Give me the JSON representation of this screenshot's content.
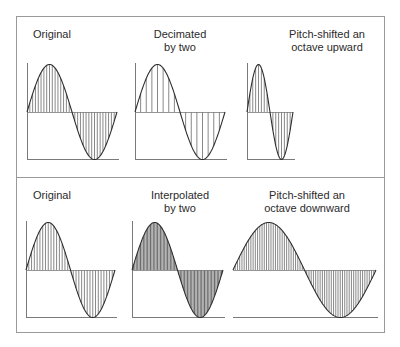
{
  "colors": {
    "frame": "#9a9a9a",
    "curve": "#2e2e2e",
    "hatch": "#555555",
    "axis": "#7a7a7a",
    "dense_fill": "#8a8a8a"
  },
  "panels": [
    {
      "name": "top",
      "labels": [
        {
          "lines": [
            "Original"
          ]
        },
        {
          "lines": [
            "Decimated",
            "by two"
          ]
        },
        {
          "lines": [
            "Pitch-shifted an",
            "octave upward"
          ]
        }
      ]
    },
    {
      "name": "bottom",
      "labels": [
        {
          "lines": [
            "Original"
          ]
        },
        {
          "lines": [
            "Interpolated",
            "by two"
          ]
        },
        {
          "lines": [
            "Pitch-shifted an",
            "octave downward"
          ]
        }
      ]
    }
  ],
  "chart_data": {
    "type": "diagram",
    "title": "",
    "waves": [
      {
        "panel": "top",
        "label": "Original",
        "x0": 27,
        "x1": 117,
        "top": 64,
        "zero": 112,
        "bottom": 159,
        "samples": 32,
        "axis": true
      },
      {
        "panel": "top",
        "label": "Decimated by two",
        "x0": 135,
        "x1": 225,
        "top": 64,
        "zero": 112,
        "bottom": 159,
        "samples": 16,
        "axis": true
      },
      {
        "panel": "top",
        "label": "Pitch-shifted an octave upward",
        "x0": 247,
        "x1": 293,
        "top": 64,
        "zero": 112,
        "bottom": 159,
        "samples": 16,
        "axis": true
      },
      {
        "panel": "bottom",
        "label": "Original",
        "x0": 26,
        "x1": 115,
        "top": 222,
        "zero": 270,
        "bottom": 317,
        "samples": 32,
        "axis": true
      },
      {
        "panel": "bottom",
        "label": "Interpolated by two",
        "x0": 132,
        "x1": 223,
        "top": 222,
        "zero": 270,
        "bottom": 317,
        "samples": 64,
        "axis": true,
        "dense": true
      },
      {
        "panel": "bottom",
        "label": "Pitch-shifted an octave downward",
        "x0": 233,
        "x1": 376,
        "top": 222,
        "zero": 270,
        "bottom": 317,
        "samples": 64,
        "axis": false
      }
    ]
  }
}
